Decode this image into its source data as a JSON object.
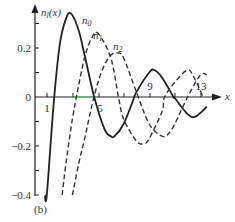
{
  "chart_data": {
    "type": "line",
    "title": "",
    "panel_label": "(b)",
    "xlabel": "x",
    "ylabel": "n_l(x)",
    "xlim": [
      0,
      15
    ],
    "ylim": [
      -0.4,
      0.35
    ],
    "x_ticks": [
      1,
      5,
      9,
      13
    ],
    "x_tick_labels": [
      "1",
      "5",
      "9",
      "13"
    ],
    "y_ticks": [
      0.2,
      0,
      -0.2,
      -0.4
    ],
    "y_tick_labels": [
      "0.2",
      "0",
      "−0.2",
      "−0.4"
    ],
    "grid": false,
    "legend_position": "inline labels near peaks",
    "series": [
      {
        "name": "n0",
        "style": "solid",
        "x": [
          0.85,
          1,
          1.5,
          2,
          2.5,
          2.9,
          3.5,
          4,
          4.7,
          5.5,
          6,
          6.3,
          7,
          7.7,
          8,
          9,
          9.4,
          10,
          10.9,
          11,
          12,
          12.6,
          13.5
        ],
        "values": [
          -0.4,
          -0.54,
          -0.05,
          0.21,
          0.32,
          0.34,
          0.27,
          0.16,
          0,
          -0.13,
          -0.16,
          -0.16,
          -0.11,
          -0.02,
          0.02,
          0.1,
          0.11,
          0.08,
          0,
          -0.004,
          -0.07,
          -0.08,
          -0.04
        ]
      },
      {
        "name": "n1",
        "style": "dashed",
        "x": [
          2.2,
          2.5,
          3,
          3.5,
          4,
          4.5,
          5,
          6,
          6.6,
          7,
          8,
          8.6,
          9,
          10,
          10.2,
          11,
          12,
          12.5,
          13.2
        ],
        "values": [
          -0.4,
          -0.27,
          -0.09,
          0.05,
          0.17,
          0.24,
          0.26,
          0.16,
          0,
          -0.09,
          -0.18,
          -0.19,
          -0.17,
          -0.06,
          0,
          0.06,
          0.11,
          0.08,
          0
        ]
      },
      {
        "name": "n2",
        "style": "dashed",
        "x": [
          3.0,
          3.5,
          4,
          4.5,
          5,
          5.5,
          6,
          6.5,
          7,
          8,
          9,
          10,
          10.5,
          11,
          12,
          13,
          13.5
        ],
        "values": [
          -0.4,
          -0.27,
          -0.16,
          -0.04,
          0.06,
          0.13,
          0.17,
          0.18,
          0.16,
          0.02,
          -0.11,
          -0.16,
          -0.15,
          -0.11,
          0,
          0.09,
          0.09
        ]
      }
    ]
  },
  "labels": {
    "y_axis": "n",
    "y_axis_sub": "l",
    "y_axis_arg": "(x)",
    "x_axis": "x",
    "n0": "n",
    "n0_sub": "0",
    "n1": "n",
    "n1_sub": "1",
    "n2": "n",
    "n2_sub": "2",
    "panel": "(b)",
    "tick_x_1": "1",
    "tick_x_5": "5",
    "tick_x_9": "9",
    "tick_x_13": "13",
    "tick_y_02": "0.2",
    "tick_y_0": "0",
    "tick_y_m02": "−0.2",
    "tick_y_m04": "−0.4"
  }
}
